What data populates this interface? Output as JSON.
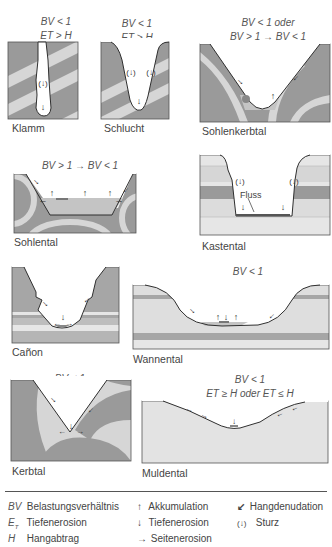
{
  "diagram": {
    "type": "valley-forms",
    "colors": {
      "dark_layer": "#9a9a9a",
      "light_layer": "#d6d6d6",
      "lighter_layer": "#e6e6e6",
      "fill_sediment": "#c4c4c4",
      "outline": "#2f2f2f"
    },
    "panels": [
      {
        "id": "klamm",
        "name": "Klamm",
        "cond_line1": "BV < 1",
        "cond_line2": "E_T > H",
        "cond1": "BV < 1",
        "cond2": "ET > H",
        "symbols": [
          "Sturz",
          "Tiefenerosion"
        ]
      },
      {
        "id": "schlucht",
        "name": "Schlucht",
        "cond1": "BV < 1",
        "cond2": "ET > H",
        "symbols": [
          "Sturz",
          "Sturz",
          "Tiefenerosion"
        ]
      },
      {
        "id": "sohlenkerbtal",
        "name": "Sohlenkerbtal",
        "cond1": "BV < 1 oder",
        "cond2": "BV > 1 → BV < 1",
        "symbols": [
          "Hangdenudation",
          "Hangdenudation",
          "Akkumulation"
        ]
      },
      {
        "id": "sohlental",
        "name": "Sohlental",
        "cond1": "BV > 1 → BV < 1",
        "cond2": "",
        "symbols": [
          "Hangdenudation",
          "Hangdenudation",
          "Seitenerosion",
          "Akkumulation",
          "Akkumulation",
          "Akkumulation",
          "Seitenerosion"
        ]
      },
      {
        "id": "kastental",
        "name": "Kastental",
        "cond1": "BV < 1",
        "cond2": "ET > H",
        "annotation": "Fluss",
        "symbols": [
          "Sturz",
          "Sturz",
          "Tiefenerosion",
          "Tiefenerosion"
        ]
      },
      {
        "id": "canon",
        "name": "Cañon",
        "cond1": "BV < 1",
        "cond2": "ET > H",
        "symbols": [
          "Hangdenudation",
          "Hangdenudation",
          "Tiefenerosion",
          "Seitenerosion",
          "Seitenerosion"
        ]
      },
      {
        "id": "wannental",
        "name": "Wannental",
        "cond1": "BV < 1",
        "cond2": "ET ≤ H",
        "symbols": [
          "Hangdenudation",
          "Hangdenudation",
          "Akkumulation",
          "Tiefenerosion",
          "Akkumulation"
        ]
      },
      {
        "id": "kerbtal",
        "name": "Kerbtal",
        "cond1": "BV < 1",
        "cond2": "ET > H",
        "symbols": [
          "Hangdenudation",
          "Hangdenudation",
          "Tiefenerosion",
          "Seitenerosion",
          "Seitenerosion"
        ]
      },
      {
        "id": "muldental",
        "name": "Muldental",
        "cond1": "BV < 1",
        "cond2": "ET ≥ H oder ET ≤ H",
        "symbols": [
          "Hangdenudation",
          "Hangdenudation",
          "Hangdenudation",
          "Hangdenudation",
          "Tiefenerosion"
        ]
      }
    ]
  },
  "legend": {
    "abbreviations": [
      {
        "sym": "BV",
        "text": "Belastungsverhältnis"
      },
      {
        "sym": "E_T",
        "text": "Tiefenerosion"
      },
      {
        "sym": "H",
        "text": "Hangabtrag"
      }
    ],
    "symbols": [
      {
        "icon": "arrow-up-icon",
        "glyph": "↑",
        "text": "Akkumulation"
      },
      {
        "icon": "arrow-down-icon",
        "glyph": "↓",
        "text": "Tiefenerosion"
      },
      {
        "icon": "arrow-right-icon",
        "glyph": "→",
        "text": "Seitenerosion"
      },
      {
        "icon": "slope-arrow-icon",
        "glyph": "↙",
        "text": "Hangdenudation"
      },
      {
        "icon": "bracket-arrow-down-icon",
        "glyph": "(↓)",
        "text": "Sturz"
      }
    ]
  }
}
